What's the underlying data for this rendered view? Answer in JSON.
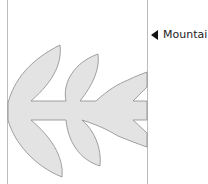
{
  "map": {
    "label": {
      "text": "Mountai",
      "marker": "left-pointing-triangle"
    },
    "colors": {
      "shape_fill": "#e3e3e3",
      "shape_stroke": "#8a8a8a",
      "border_line": "#bdbdbd",
      "background": "#ffffff"
    },
    "feature": "leaf-shaped pictograph"
  }
}
